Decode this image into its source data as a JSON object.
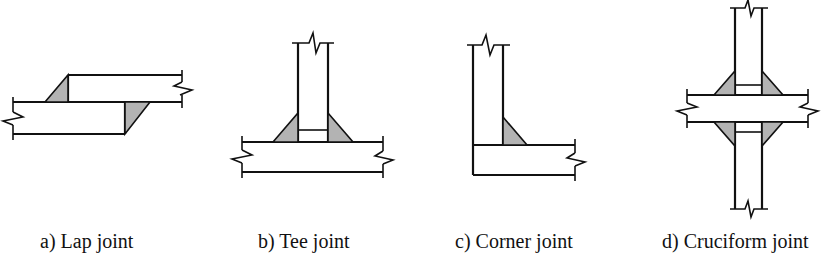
{
  "figure": {
    "captions": {
      "lap": "a) Lap joint",
      "tee": "b) Tee joint",
      "corner": "c) Corner joint",
      "cruciform": "d) Cruciform joint"
    },
    "colors": {
      "outline": "#111111",
      "weld_fill": "#b3b3b3",
      "plate_fill": "#ffffff",
      "background": "#ffffff"
    }
  }
}
